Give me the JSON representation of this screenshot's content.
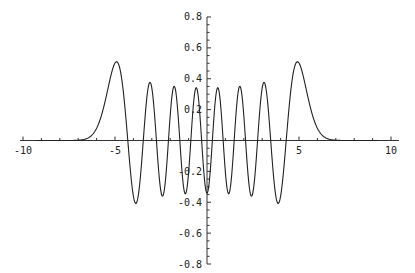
{
  "chart_data": {
    "type": "line",
    "title": "",
    "xlabel": "",
    "ylabel": "",
    "xlim": [
      -10,
      10
    ],
    "ylim": [
      -0.8,
      0.8
    ],
    "grid": false,
    "legend": null,
    "axes_style": "mathematica-origin-axes",
    "x_ticks": [
      -10,
      -5,
      5,
      10
    ],
    "x_tick_labels": [
      "-10",
      "-5",
      "5",
      "10"
    ],
    "x_minor_step": 1,
    "y_ticks": [
      -0.8,
      -0.6,
      -0.4,
      -0.2,
      0.2,
      0.4,
      0.6,
      0.8
    ],
    "y_tick_labels": [
      "-0.8",
      "-0.6",
      "-0.4",
      "-0.2",
      "0.2",
      "0.4",
      "0.6",
      "0.8"
    ],
    "y_minor_step": 0.05,
    "series": [
      {
        "name": "psi_14(x)",
        "description": "Even oscillatory function with Gaussian envelope (harmonic-oscillator eigenfunction, n=14)",
        "hermite_n": 14,
        "color": "#222222",
        "extrema": [
          {
            "x": -4.9,
            "y": 0.51
          },
          {
            "x": -3.8,
            "y": -0.41
          },
          {
            "x": -3.1,
            "y": 0.38
          },
          {
            "x": -2.4,
            "y": -0.36
          },
          {
            "x": -1.7,
            "y": 0.355
          },
          {
            "x": -1.15,
            "y": -0.345
          },
          {
            "x": -0.6,
            "y": 0.35
          },
          {
            "x": 0.0,
            "y": -0.34
          },
          {
            "x": 0.6,
            "y": 0.35
          },
          {
            "x": 1.15,
            "y": -0.345
          },
          {
            "x": 1.7,
            "y": 0.355
          },
          {
            "x": 2.4,
            "y": -0.36
          },
          {
            "x": 3.1,
            "y": 0.38
          },
          {
            "x": 3.8,
            "y": -0.41
          },
          {
            "x": 4.9,
            "y": 0.51
          }
        ],
        "support_approx": [
          -7.2,
          7.2
        ]
      }
    ]
  }
}
